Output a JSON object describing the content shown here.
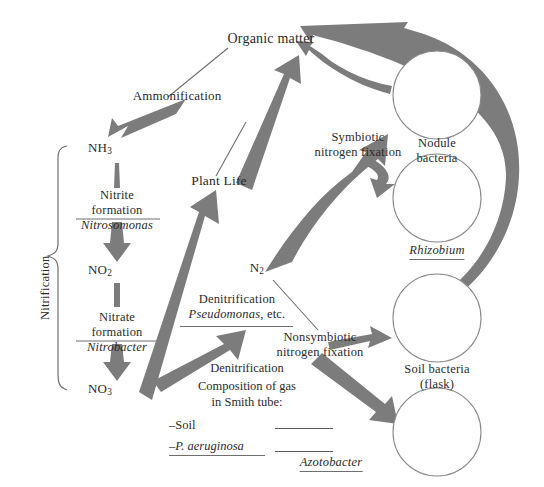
{
  "diagram": {
    "colors": {
      "arrow": "#7c7c7c",
      "arrow_dark": "#6e6e6e",
      "line": "#6f6f6f",
      "text": "#2b2b2b",
      "background": "#ffffff",
      "circle_stroke": "#8a8a8a"
    },
    "nodes": {
      "organic_matter": "Organic matter",
      "ammonia": "NH",
      "ammonia_sub": "3",
      "nitrite": "NO",
      "nitrite_sub": "2",
      "nitrate": "NO",
      "nitrate_sub": "3",
      "dinitrogen": "N",
      "dinitrogen_sub": "2",
      "plant_life": "Plant Life"
    },
    "processes": {
      "ammonification": "Ammonification",
      "nitrite_formation_line1": "Nitrite",
      "nitrite_formation_line2": "formation",
      "nitrite_organism": "Nitrosomonas",
      "nitrate_formation_line1": "Nitrate",
      "nitrate_formation_line2": "formation",
      "nitrate_organism": "Nitrobacter",
      "nitrification": "Nitrification",
      "denitrification": "Denitrification",
      "denitrification_organism": "Pseudomonas",
      "denitrification_organism_suffix": ", etc.",
      "symbiotic_line1": "Symbiotic",
      "symbiotic_line2": "nitrogen fixation",
      "nonsymbiotic_line1": "Nonsymbiotic",
      "nonsymbiotic_line2": "nitrogen fixation"
    },
    "cultures": {
      "nodule_line1": "Nodule",
      "nodule_line2": "bacteria",
      "rhizobium": "Rhizobium",
      "soil_line1": "Soil bacteria",
      "soil_line2": "(flask)",
      "azotobacter": "Azotobacter"
    },
    "legend": {
      "title": "Denitrification",
      "caption_line1": "Composition of gas",
      "caption_line2": "in Smith tube:",
      "items": [
        {
          "label": "–Soil",
          "italic": false
        },
        {
          "label": "–P. aeruginosa",
          "italic": true
        }
      ]
    }
  }
}
